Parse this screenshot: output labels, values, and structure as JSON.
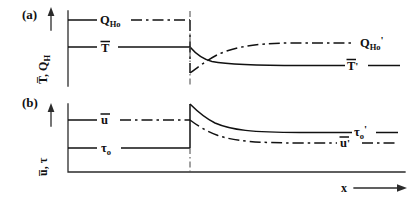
{
  "figure": {
    "type": "line",
    "background_color": "#ffffff",
    "line_color": "#111111",
    "axis_color": "#2b2b2b"
  },
  "panels": [
    {
      "tag": "(a)",
      "y_axis_label": "T, Q",
      "y_axis_label_parts": {
        "first": "T",
        "first_overbar": true,
        "separator": ", ",
        "second": "Q",
        "second_sub": "H"
      },
      "y_axis_arrow": "up",
      "curves": [
        {
          "name": "Q_Ho",
          "label": "Q",
          "label_sub": "Ho",
          "label_prime": "",
          "style": "dash-dot",
          "side": "left",
          "level": "upper",
          "behavior": "constant then drops at discontinuity"
        },
        {
          "name": "T_bar",
          "label": "T",
          "label_overbar": true,
          "label_sub": "",
          "label_prime": "",
          "style": "solid",
          "side": "left",
          "level": "middle",
          "behavior": "constant then decays to lower asymptote"
        },
        {
          "name": "Q_Ho_prime",
          "label": "Q",
          "label_sub": "Ho",
          "label_prime": "'",
          "style": "dash-dot",
          "side": "right",
          "level": "upper-mid",
          "behavior": "rises from discontinuity to upper asymptote"
        },
        {
          "name": "T_bar_prime",
          "label": "T",
          "label_overbar": true,
          "label_sub": "",
          "label_prime": "'",
          "style": "solid",
          "side": "right",
          "level": "lower-mid",
          "behavior": "lower asymptote downstream"
        }
      ]
    },
    {
      "tag": "(b)",
      "y_axis_label": "u, τ",
      "y_axis_label_parts": {
        "first": "u",
        "first_overbar": true,
        "separator": ", ",
        "second": "τ",
        "second_sub": ""
      },
      "y_axis_arrow": "up",
      "curves": [
        {
          "name": "u_bar",
          "label": "u",
          "label_overbar": true,
          "label_sub": "",
          "label_prime": "",
          "style": "dash-dot",
          "side": "left",
          "level": "upper",
          "behavior": "constant upstream"
        },
        {
          "name": "tau_o",
          "label": "τ",
          "label_sub": "o",
          "label_prime": "",
          "style": "solid",
          "side": "left",
          "level": "lower",
          "behavior": "constant then jumps up at discontinuity"
        },
        {
          "name": "tau_o_prime",
          "label": "τ",
          "label_sub": "o",
          "label_prime": "'",
          "style": "solid",
          "side": "right",
          "level": "upper",
          "behavior": "decays from jump peak to asymptote"
        },
        {
          "name": "u_bar_prime",
          "label": "u",
          "label_overbar": true,
          "label_sub": "",
          "label_prime": "'",
          "style": "dash-dot",
          "side": "right",
          "level": "lower",
          "behavior": "decays to lower asymptote"
        }
      ]
    }
  ],
  "x_axis": {
    "label": "x",
    "arrow": "right",
    "ticks": [],
    "discontinuity_marker": "vertical dash-dot line"
  }
}
